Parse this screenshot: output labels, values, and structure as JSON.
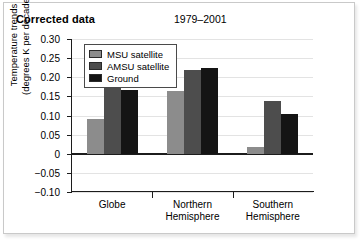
{
  "header": {
    "title": "Corrected data",
    "period": "1979–2001"
  },
  "legend": {
    "position": "top-left-inside",
    "items": [
      {
        "label": "MSU satellite",
        "color": "#8c8c8c"
      },
      {
        "label": "AMSU satellite",
        "color": "#4d4d4d"
      },
      {
        "label": "Ground",
        "color": "#141414"
      }
    ]
  },
  "axis": {
    "y_label_line1": "Temperature trends",
    "y_label_line2": "(degrees K per decade)",
    "y_ticks": [
      "0.30",
      "0.25",
      "0.20",
      "0.15",
      "0.10",
      "0.05",
      "0",
      "−0.05",
      "−0.10"
    ]
  },
  "chart_data": {
    "type": "bar",
    "title": "Corrected data",
    "subtitle": "1979–2001",
    "xlabel": "",
    "ylabel": "Temperature trends (degrees K per decade)",
    "categories": [
      "Globe",
      "Northern\nHemisphere",
      "Southern\nHemisphere"
    ],
    "series": [
      {
        "name": "MSU satellite",
        "color": "#8c8c8c",
        "values": [
          0.09,
          0.165,
          0.018
        ]
      },
      {
        "name": "AMSU satellite",
        "color": "#4d4d4d",
        "values": [
          0.176,
          0.218,
          0.138
        ]
      },
      {
        "name": "Ground",
        "color": "#141414",
        "values": [
          0.166,
          0.225,
          0.105
        ]
      }
    ],
    "ylim": [
      -0.1,
      0.3
    ],
    "ytick_values": [
      0.3,
      0.25,
      0.2,
      0.15,
      0.1,
      0.05,
      0.0,
      -0.05,
      -0.1
    ],
    "grid": true,
    "zero_line": true,
    "legend_position": "upper left"
  }
}
